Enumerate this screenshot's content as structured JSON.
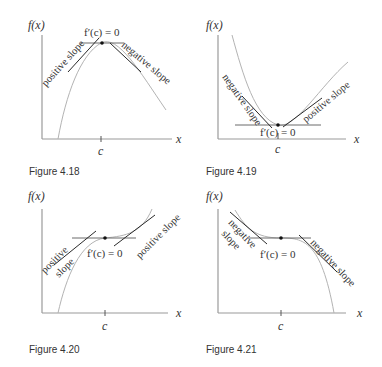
{
  "figures": [
    {
      "id": "fig-4-18",
      "caption": "Figure 4.18",
      "y_axis_label": "f(x)",
      "x_axis_label": "x",
      "tick_label": "c",
      "derivative_label": "f′(c) = 0",
      "left_tangent_label": "positive slope",
      "right_tangent_label": "negative slope",
      "extremum": "local maximum"
    },
    {
      "id": "fig-4-19",
      "caption": "Figure 4.19",
      "y_axis_label": "f(x)",
      "x_axis_label": "x",
      "tick_label": "c",
      "derivative_label": "f′(c) = 0",
      "left_tangent_label": "negative slope",
      "right_tangent_label": "positive slope",
      "extremum": "local minimum"
    },
    {
      "id": "fig-4-20",
      "caption": "Figure 4.20",
      "y_axis_label": "f(x)",
      "x_axis_label": "x",
      "tick_label": "c",
      "derivative_label": "f′(c) = 0",
      "left_tangent_label_line1": "positive",
      "left_tangent_label_line2": "slope",
      "right_tangent_label": "positive slope",
      "extremum": "none (increasing inflection)"
    },
    {
      "id": "fig-4-21",
      "caption": "Figure 4.21",
      "y_axis_label": "f(x)",
      "x_axis_label": "x",
      "tick_label": "c",
      "derivative_label": "f′(c) = 0",
      "left_tangent_label_line1": "negative",
      "left_tangent_label_line2": "slope",
      "right_tangent_label": "negative slope",
      "extremum": "none (decreasing inflection)"
    }
  ],
  "colors": {
    "axis": "#9a9a9a",
    "curve": "#b3b3b3",
    "tangent": "#2a2a2a",
    "text": "#333333"
  }
}
